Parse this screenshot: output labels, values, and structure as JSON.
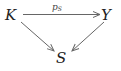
{
  "diagram": {
    "type": "commutative-triangle",
    "nodes": [
      {
        "id": "K",
        "label": "K"
      },
      {
        "id": "Y",
        "label": "Y"
      },
      {
        "id": "S",
        "label": "S"
      }
    ],
    "edges": [
      {
        "from": "K",
        "to": "Y",
        "label_main": "p",
        "label_sub": "S"
      },
      {
        "from": "K",
        "to": "S",
        "label_main": "",
        "label_sub": ""
      },
      {
        "from": "Y",
        "to": "S",
        "label_main": "",
        "label_sub": ""
      }
    ],
    "colors": {
      "node_text": "#222222",
      "arrow": "#666666",
      "background": "#ffffff"
    }
  }
}
